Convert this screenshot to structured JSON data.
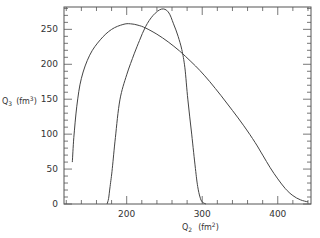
{
  "chart_data": {
    "type": "line",
    "title": "",
    "xlabel": "Q2 (fm2)",
    "xlabel_parts": {
      "base": "Q",
      "sub": "2",
      "unit_pre": "(fm",
      "sup": "2",
      "unit_post": ")"
    },
    "ylabel": "Q3 (fm3)",
    "ylabel_parts": {
      "base": "Q",
      "sub": "3",
      "unit_pre": "(fm",
      "sup": "3",
      "unit_post": ")"
    },
    "xlim": [
      117,
      444
    ],
    "ylim": [
      0,
      282
    ],
    "xticks": [
      200,
      300,
      400
    ],
    "yticks": [
      0,
      50,
      100,
      150,
      200,
      250
    ],
    "grid": false,
    "legend": null,
    "series": [
      {
        "name": "broad-distribution",
        "points": [
          [
            128,
            60
          ],
          [
            130,
            95
          ],
          [
            134,
            140
          ],
          [
            140,
            180
          ],
          [
            151,
            213
          ],
          [
            165,
            235
          ],
          [
            180,
            250
          ],
          [
            195,
            257
          ],
          [
            205,
            258
          ],
          [
            215,
            256
          ],
          [
            225,
            252
          ],
          [
            240,
            243
          ],
          [
            255,
            232
          ],
          [
            270,
            219
          ],
          [
            285,
            204
          ],
          [
            297,
            191
          ],
          [
            310,
            175
          ],
          [
            325,
            155
          ],
          [
            340,
            134
          ],
          [
            355,
            112
          ],
          [
            370,
            88
          ],
          [
            380,
            70
          ],
          [
            390,
            52
          ],
          [
            400,
            36
          ],
          [
            410,
            22
          ],
          [
            420,
            12
          ],
          [
            430,
            6
          ],
          [
            440,
            3
          ]
        ]
      },
      {
        "name": "narrow-distribution",
        "points": [
          [
            174,
            0
          ],
          [
            176,
            8
          ],
          [
            178,
            25
          ],
          [
            181,
            51
          ],
          [
            185,
            95
          ],
          [
            191,
            149
          ],
          [
            200,
            185
          ],
          [
            210,
            215
          ],
          [
            217,
            234
          ],
          [
            225,
            254
          ],
          [
            235,
            270
          ],
          [
            246,
            279
          ],
          [
            255,
            275
          ],
          [
            262,
            258
          ],
          [
            268,
            240
          ],
          [
            273,
            221
          ],
          [
            277,
            195
          ],
          [
            281,
            149
          ],
          [
            286,
            100
          ],
          [
            291,
            51
          ],
          [
            294,
            25
          ],
          [
            297,
            10
          ],
          [
            300,
            3
          ],
          [
            305,
            0
          ]
        ]
      }
    ]
  }
}
